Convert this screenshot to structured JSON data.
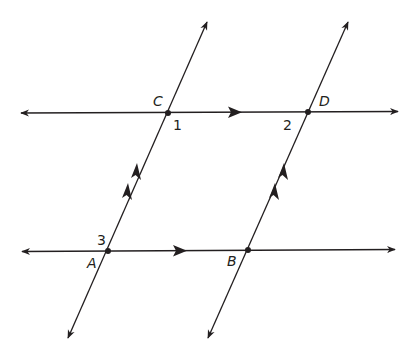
{
  "diagram": {
    "type": "geometry-parallel-lines",
    "colors": {
      "stroke": "#231f20",
      "background": "#ffffff"
    },
    "points": {
      "A": {
        "label": "A",
        "x": 108,
        "y": 251
      },
      "B": {
        "label": "B",
        "x": 248,
        "y": 251
      },
      "C": {
        "label": "C",
        "x": 168,
        "y": 113
      },
      "D": {
        "label": "D",
        "x": 308,
        "y": 113
      }
    },
    "angles": {
      "angle1": {
        "label": "1"
      },
      "angle2": {
        "label": "2"
      },
      "angle3": {
        "label": "3"
      }
    },
    "lines": [
      {
        "name": "line-CD",
        "description": "top horizontal line through C and D",
        "parallel_marker": "single-arrow"
      },
      {
        "name": "line-AB",
        "description": "bottom horizontal line through A and B",
        "parallel_marker": "single-arrow"
      },
      {
        "name": "line-AC",
        "description": "left transversal through A and C",
        "parallel_marker": "double-arrow"
      },
      {
        "name": "line-BD",
        "description": "right transversal through B and D",
        "parallel_marker": "double-arrow"
      }
    ]
  }
}
